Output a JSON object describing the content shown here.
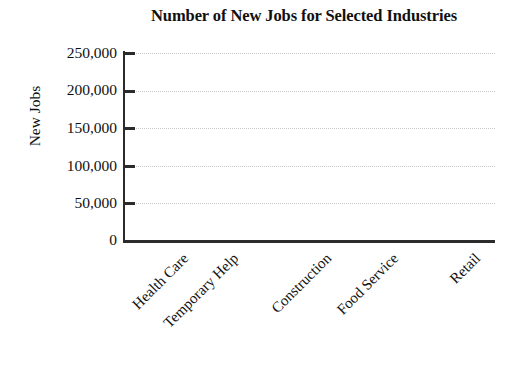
{
  "chart_data": {
    "type": "bar",
    "title": "Number of New Jobs for Selected Industries",
    "xlabel": "",
    "ylabel": "New Jobs",
    "categories": [
      "Health Care",
      "Temporary Help",
      "Construction",
      "Food Service",
      "Retail"
    ],
    "values": [
      null,
      null,
      null,
      null,
      null
    ],
    "series": [
      {
        "name": "New Jobs",
        "values": [
          null,
          null,
          null,
          null,
          null
        ]
      }
    ],
    "ylim": [
      0,
      250000
    ],
    "ytick_values": [
      250000,
      200000,
      150000,
      100000,
      50000,
      0
    ],
    "ytick_labels": [
      "250,000",
      "200,000",
      "150,000",
      "100,000",
      "50,000",
      "0"
    ],
    "ytick_interval": 50000,
    "grid": true,
    "grid_axis": "y",
    "grid_style": "dotted",
    "legend": false,
    "legend_position": "none",
    "xtick_label_rotation": 45,
    "note": "Empty plot area - no bars drawn; blank chart template",
    "colors": {
      "axis": "#2b2b2b",
      "gridline": "#c9c9c9",
      "text": "#111111",
      "background": "#ffffff"
    }
  },
  "axis_ticks": [
    {
      "label": "250,000",
      "value": 250000
    },
    {
      "label": "200,000",
      "value": 200000
    },
    {
      "label": "150,000",
      "value": 150000
    },
    {
      "label": "100,000",
      "value": 100000
    },
    {
      "label": "50,000",
      "value": 50000
    },
    {
      "label": "0",
      "value": 0
    }
  ],
  "categories": [
    {
      "label": "Health Care"
    },
    {
      "label": "Temporary Help"
    },
    {
      "label": "Construction"
    },
    {
      "label": "Food Service"
    },
    {
      "label": "Retail"
    }
  ]
}
